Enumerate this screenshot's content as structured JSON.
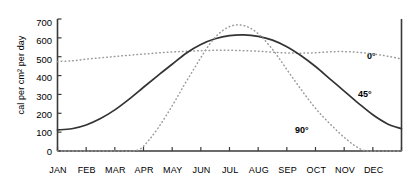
{
  "chart_data": {
    "type": "line",
    "title": "",
    "xlabel": "",
    "ylabel": "cal per cm2 per day",
    "ylabel_display": "cal per cm² per day",
    "xlim": [
      0,
      12
    ],
    "ylim": [
      0,
      700
    ],
    "grid": false,
    "legend_position": "inline-annotations",
    "y_ticks": [
      0,
      100,
      200,
      300,
      400,
      500,
      600,
      700
    ],
    "y_tick_labels": [
      "0",
      "100",
      "200",
      "300",
      "400",
      "500",
      "600",
      "700"
    ],
    "categories": [
      "JAN",
      "FEB",
      "MAR",
      "APR",
      "MAY",
      "JUN",
      "JUL",
      "AUG",
      "SEP",
      "OCT",
      "NOV",
      "DEC"
    ],
    "series": [
      {
        "name": "0°",
        "label": "0",
        "degree_symbol": "°",
        "style": "dotted",
        "color": "#999999",
        "values": [
          478,
          492,
          505,
          518,
          528,
          534,
          533,
          528,
          519,
          525,
          520,
          497
        ],
        "points": [
          [
            0.0,
            475
          ],
          [
            0.5,
            478
          ],
          [
            1.0,
            487
          ],
          [
            1.5,
            494
          ],
          [
            2.0,
            501
          ],
          [
            2.5,
            508
          ],
          [
            3.0,
            514
          ],
          [
            3.5,
            520
          ],
          [
            4.0,
            525
          ],
          [
            4.5,
            529
          ],
          [
            5.0,
            532
          ],
          [
            5.5,
            534
          ],
          [
            6.0,
            534
          ],
          [
            6.5,
            532
          ],
          [
            7.0,
            529
          ],
          [
            7.5,
            524
          ],
          [
            8.0,
            520
          ],
          [
            8.5,
            519
          ],
          [
            9.0,
            521
          ],
          [
            9.5,
            526
          ],
          [
            10.0,
            527
          ],
          [
            10.5,
            523
          ],
          [
            11.0,
            515
          ],
          [
            11.5,
            503
          ],
          [
            12.0,
            488
          ]
        ]
      },
      {
        "name": "45°",
        "label": "45",
        "degree_symbol": "°",
        "style": "solid",
        "color": "#333333",
        "values": [
          113,
          160,
          245,
          360,
          490,
          590,
          612,
          575,
          470,
          330,
          195,
          120
        ],
        "points": [
          [
            0.0,
            112
          ],
          [
            0.5,
            118
          ],
          [
            1.0,
            138
          ],
          [
            1.5,
            172
          ],
          [
            2.0,
            218
          ],
          [
            2.5,
            275
          ],
          [
            3.0,
            338
          ],
          [
            3.5,
            400
          ],
          [
            4.0,
            460
          ],
          [
            4.5,
            520
          ],
          [
            5.0,
            565
          ],
          [
            5.5,
            595
          ],
          [
            6.0,
            612
          ],
          [
            6.5,
            616
          ],
          [
            7.0,
            608
          ],
          [
            7.5,
            588
          ],
          [
            8.0,
            553
          ],
          [
            8.5,
            505
          ],
          [
            9.0,
            448
          ],
          [
            9.5,
            383
          ],
          [
            10.0,
            318
          ],
          [
            10.5,
            253
          ],
          [
            11.0,
            192
          ],
          [
            11.5,
            145
          ],
          [
            12.0,
            118
          ]
        ]
      },
      {
        "name": "90°",
        "label": "90",
        "degree_symbol": "°",
        "style": "dotted",
        "color": "#999999",
        "values": [
          0,
          0,
          5,
          120,
          355,
          600,
          660,
          560,
          330,
          85,
          0,
          0
        ],
        "points": [
          [
            0.0,
            0
          ],
          [
            1.0,
            0
          ],
          [
            2.0,
            0
          ],
          [
            2.6,
            0
          ],
          [
            2.9,
            12
          ],
          [
            3.2,
            60
          ],
          [
            3.5,
            120
          ],
          [
            3.8,
            190
          ],
          [
            4.1,
            265
          ],
          [
            4.4,
            345
          ],
          [
            4.7,
            420
          ],
          [
            5.0,
            495
          ],
          [
            5.3,
            565
          ],
          [
            5.6,
            618
          ],
          [
            5.9,
            652
          ],
          [
            6.2,
            668
          ],
          [
            6.5,
            665
          ],
          [
            6.8,
            645
          ],
          [
            7.1,
            608
          ],
          [
            7.4,
            558
          ],
          [
            7.7,
            498
          ],
          [
            8.0,
            432
          ],
          [
            8.3,
            368
          ],
          [
            8.6,
            305
          ],
          [
            8.9,
            245
          ],
          [
            9.2,
            192
          ],
          [
            9.5,
            145
          ],
          [
            9.8,
            100
          ],
          [
            10.1,
            60
          ],
          [
            10.4,
            25
          ],
          [
            10.7,
            2
          ],
          [
            10.9,
            0
          ],
          [
            11.5,
            0
          ],
          [
            12.0,
            0
          ]
        ]
      }
    ],
    "annotations": [
      {
        "name": "label-0deg",
        "text": "0°",
        "series": "0°"
      },
      {
        "name": "label-45deg",
        "text": "45°",
        "series": "45°"
      },
      {
        "name": "label-90deg",
        "text": "90°",
        "series": "90°"
      }
    ]
  },
  "axis": {
    "y_ticks": [
      "700",
      "600",
      "500",
      "400",
      "300",
      "200",
      "100",
      "0"
    ],
    "x_ticks": [
      "JAN",
      "FEB",
      "MAR",
      "APR",
      "MAY",
      "JUN",
      "JUL",
      "AUG",
      "SEP",
      "OCT",
      "NOV",
      "DEC"
    ],
    "ylabel": "cal per cm² per day"
  },
  "labels": {
    "zero_deg": "0°",
    "fortyfive_deg": "45°",
    "ninety_deg": "90°"
  }
}
